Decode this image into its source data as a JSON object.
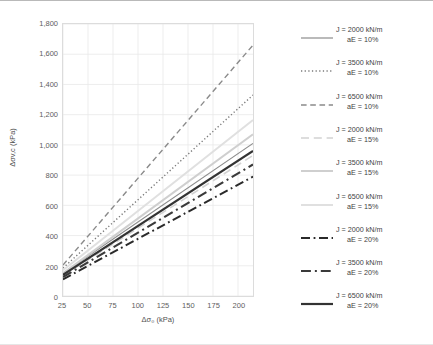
{
  "chart_data": {
    "type": "line",
    "title": "",
    "xlabel": "Δσ₀ (kPa)",
    "ylabel": "Δσv,c (kPa)",
    "xlim": [
      25,
      215
    ],
    "ylim": [
      0,
      1800
    ],
    "xticks": [
      25,
      50,
      75,
      100,
      125,
      150,
      175,
      200
    ],
    "yticks": [
      0,
      200,
      400,
      600,
      800,
      1000,
      1200,
      1400,
      1600,
      1800
    ],
    "ytick_labels": [
      "0",
      "200",
      "400",
      "600",
      "800",
      "1,000",
      "1,200",
      "1,400",
      "1,600",
      "1,800"
    ],
    "xtick_labels": [
      "25",
      "50",
      "75",
      "100",
      "125",
      "150",
      "175",
      "200"
    ],
    "grid": true,
    "grid_color": "#e8e8e8",
    "legend_position": "right",
    "series": [
      {
        "name": "J = 2000 kN/m  aE = 10%",
        "label_line1": "J = 2000 kN/m",
        "label_line2": "aE = 10%",
        "dash": "solid",
        "color": "#8c8c8c",
        "width": 1.2,
        "x": [
          25,
          215
        ],
        "y": [
          150,
          1010
        ]
      },
      {
        "name": "J = 3500 kN/m  aE = 10%",
        "label_line1": "J = 3500 kN/m",
        "label_line2": "aE = 10%",
        "dash": "dotted",
        "color": "#7a7a7a",
        "width": 1.4,
        "x": [
          25,
          215
        ],
        "y": [
          185,
          1330
        ]
      },
      {
        "name": "J = 6500 kN/m  aE = 10%",
        "label_line1": "J = 6500 kN/m",
        "label_line2": "aE = 10%",
        "dash": "dashed",
        "color": "#8a8a8a",
        "width": 1.4,
        "x": [
          25,
          215
        ],
        "y": [
          205,
          1660
        ]
      },
      {
        "name": "J = 2000 kN/m  aE = 15%",
        "label_line1": "J = 2000 kN/m",
        "label_line2": "aE = 15%",
        "dash": "longdash",
        "color": "#d2d2d2",
        "width": 1.6,
        "x": [
          25,
          215
        ],
        "y": [
          135,
          930
        ]
      },
      {
        "name": "J = 3500 kN/m  aE = 15%",
        "label_line1": "J = 3500 kN/m",
        "label_line2": "aE = 15%",
        "dash": "solid",
        "color": "#cfcfcf",
        "width": 2.0,
        "x": [
          25,
          215
        ],
        "y": [
          150,
          1070
        ]
      },
      {
        "name": "J = 6500 kN/m  aE = 15%",
        "label_line1": "J = 6500 kN/m",
        "label_line2": "aE = 15%",
        "dash": "solid",
        "color": "#e0e0e0",
        "width": 2.0,
        "x": [
          25,
          215
        ],
        "y": [
          170,
          1165
        ]
      },
      {
        "name": "J = 2000 kN/m  aE = 20%",
        "label_line1": "J = 2000 kN/m",
        "label_line2": "aE = 20%",
        "dash": "dashdot",
        "color": "#2a2a2a",
        "width": 2.0,
        "x": [
          25,
          215
        ],
        "y": [
          110,
          790
        ]
      },
      {
        "name": "J = 3500 kN/m  aE = 20%",
        "label_line1": "J = 3500 kN/m",
        "label_line2": "aE = 20%",
        "dash": "dashdot",
        "color": "#3a3a3a",
        "width": 2.2,
        "x": [
          25,
          215
        ],
        "y": [
          125,
          870
        ]
      },
      {
        "name": "J = 6500 kN/m  aE = 20%",
        "label_line1": "J = 6500 kN/m",
        "label_line2": "aE = 20%",
        "dash": "solid",
        "color": "#333333",
        "width": 2.2,
        "x": [
          25,
          215
        ],
        "y": [
          140,
          960
        ]
      }
    ]
  }
}
